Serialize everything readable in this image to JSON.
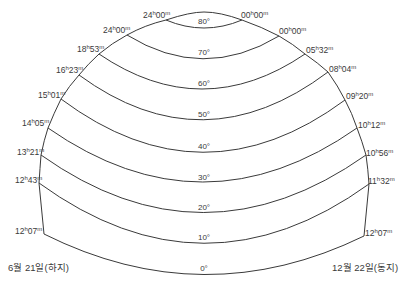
{
  "diagram": {
    "type": "sun-altitude-time-chart",
    "stroke_color": "#3a3a3a",
    "altitude_lines": [
      {
        "deg": "80°",
        "left_time": {
          "h": "24",
          "m": "00"
        },
        "right_time": {
          "h": "00",
          "m": "00"
        }
      },
      {
        "deg": "70°",
        "left_time": {
          "h": "24",
          "m": "00"
        },
        "right_time": {
          "h": "00",
          "m": "00"
        }
      },
      {
        "deg": "60°",
        "left_time": {
          "h": "18",
          "m": "53"
        },
        "right_time": {
          "h": "05",
          "m": "32"
        }
      },
      {
        "deg": "50°",
        "left_time": {
          "h": "16",
          "m": "23"
        },
        "right_time": {
          "h": "08",
          "m": "04"
        }
      },
      {
        "deg": "40°",
        "left_time": {
          "h": "15",
          "m": "01"
        },
        "right_time": {
          "h": "09",
          "m": "20"
        }
      },
      {
        "deg": "30°",
        "left_time": {
          "h": "14",
          "m": "05"
        },
        "right_time": {
          "h": "10",
          "m": "12"
        }
      },
      {
        "deg": "20°",
        "left_time": {
          "h": "13",
          "m": "21"
        },
        "right_time": {
          "h": "10",
          "m": "56"
        }
      },
      {
        "deg": "10°",
        "left_time": {
          "h": "12",
          "m": "43"
        },
        "right_time": {
          "h": "11",
          "m": "32"
        }
      },
      {
        "deg": "0°",
        "left_time": {
          "h": "12",
          "m": "07"
        },
        "right_time": {
          "h": "12",
          "m": "07"
        }
      }
    ],
    "degree_labels": [
      "80°",
      "70°",
      "60°",
      "50°",
      "40°",
      "30°",
      "20°",
      "10°",
      "0°"
    ],
    "left_labels": [
      "24h00m",
      "24h00m",
      "18h53m",
      "16h23m",
      "15h01m",
      "14h05m",
      "13h21m",
      "12h43m",
      "12h07m"
    ],
    "right_labels": [
      "00h00m",
      "00h00m",
      "05h32m",
      "08h04m",
      "09h20m",
      "10h12m",
      "10h56m",
      "11h32m",
      "12h07m"
    ],
    "unit_h": "h",
    "unit_m": "m",
    "left_date": "6월 21일(하지)",
    "right_date": "12월 22일(동지)"
  }
}
